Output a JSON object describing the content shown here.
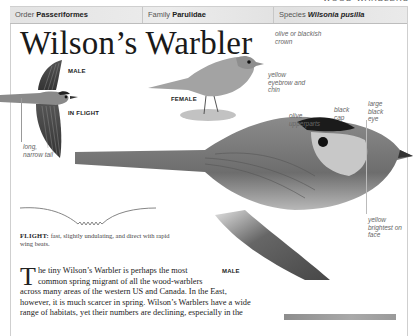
{
  "running_head": "WOOD-WARBLERS",
  "taxonomy": {
    "order_label": "Order",
    "order_value": "Passeriformes",
    "family_label": "Family",
    "family_value": "Parulidae",
    "species_label": "Species",
    "species_value": "Wilsonia pusilla"
  },
  "title": "Wilson’s Warbler",
  "illustrations": {
    "flight_bird": {
      "labels": [
        "MALE",
        "IN FLIGHT"
      ],
      "annotation": "long, narrow tail"
    },
    "female": {
      "label": "FEMALE",
      "annotations": [
        "olive or blackish crown",
        "yellow eyebrow and chin"
      ]
    },
    "male": {
      "label": "MALE",
      "annotations": [
        "olive upperparts",
        "black cap",
        "large black eye",
        "yellow brightest on face"
      ]
    }
  },
  "flight": {
    "heading": "FLIGHT:",
    "text": "fast, slightly undulating, and direct with rapid wing beats."
  },
  "body": {
    "dropcap": "T",
    "lines": [
      "he tiny Wilson’s Warbler is perhaps the most",
      "common spring migrant of all the wood-warblers",
      "across many areas of the western US and Canada. In the East,",
      "however, it is much scarcer in spring. Wilson’s Warblers have a wide",
      "range of habitats, yet their numbers are declining, especially in the"
    ]
  },
  "colors": {
    "taxbar_bg": "#e6e6e6",
    "frame_border": "#cfcfcf",
    "annotation_text": "#666666"
  }
}
